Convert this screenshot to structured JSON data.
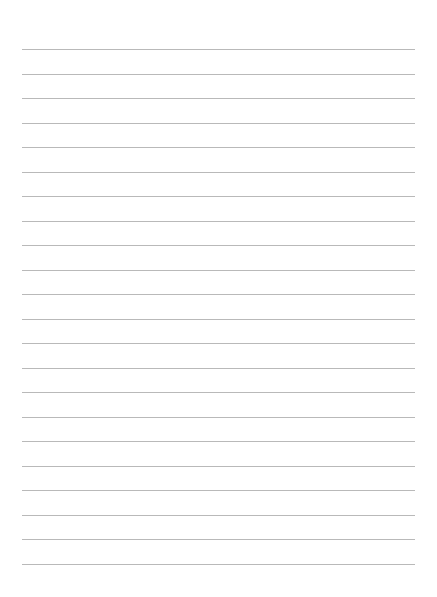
{
  "page": {
    "type": "lined-paper",
    "background_color": "#ffffff",
    "line_color": "#b9b9b9",
    "line_count": 22,
    "first_line_y": 49,
    "line_spacing": 24.5,
    "line_left": 22,
    "line_right": 415
  }
}
